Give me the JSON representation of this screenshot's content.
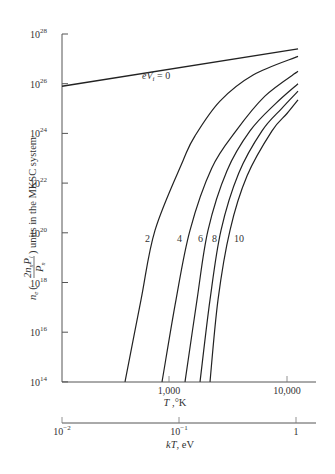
{
  "chart_data": {
    "type": "line",
    "title": "",
    "xlabel": "T, °K",
    "ylabel": "n_e (2 n_n P_i / P_n) units in the MKSC system",
    "secondary_xlabel": "kT, eV",
    "xscale": "log",
    "yscale": "log",
    "xlim": [
      124,
      21000
    ],
    "ylim": [
      100000000000000.0,
      1e+28
    ],
    "grid": false,
    "x_ticks": [
      {
        "value": 1000,
        "label": "1,000"
      },
      {
        "value": 10000,
        "label": "10,000"
      }
    ],
    "y_ticks": [
      {
        "value": 100000000000000.0,
        "base": "10",
        "exp": "14"
      },
      {
        "value": 1e+16,
        "base": "10",
        "exp": "16"
      },
      {
        "value": 1e+18,
        "base": "10",
        "exp": "18"
      },
      {
        "value": 1e+20,
        "base": "10",
        "exp": "20"
      },
      {
        "value": 1e+22,
        "base": "10",
        "exp": "22"
      },
      {
        "value": 1e+24,
        "base": "10",
        "exp": "24"
      },
      {
        "value": 1e+26,
        "base": "10",
        "exp": "26"
      },
      {
        "value": 1e+28,
        "base": "10",
        "exp": "28"
      }
    ],
    "secondary_x_ticks": [
      {
        "value": 0.01,
        "base": "10",
        "exp": "−2"
      },
      {
        "value": 0.1,
        "base": "10",
        "exp": "−1"
      },
      {
        "value": 1,
        "base": "1",
        "exp": ""
      }
    ],
    "series": [
      {
        "name": "eVi = 0",
        "label": "eV",
        "label_sub": "i",
        "label_tail": " = 0",
        "x": [
          124,
          12400
        ],
        "log10_y": [
          25.9,
          27.4
        ]
      },
      {
        "name": "2",
        "label": "2",
        "x": [
          424,
          579,
          761,
          1314,
          1661,
          2704,
          5157,
          12400
        ],
        "log10_y": [
          14.0,
          17.3,
          20.1,
          22.9,
          23.9,
          25.3,
          26.35,
          27.1
        ]
      },
      {
        "name": "4",
        "label": "4",
        "x": [
          873,
          1146,
          1506,
          2300,
          3694,
          6500,
          12400
        ],
        "log10_y": [
          14.0,
          17.3,
          20.1,
          22.6,
          24.1,
          25.5,
          26.5
        ]
      },
      {
        "name": "6",
        "label": "6",
        "x": [
          1366,
          1727,
          2139,
          3100,
          4855,
          8000,
          12400
        ],
        "log10_y": [
          14.0,
          17.3,
          20.1,
          22.5,
          24.1,
          25.2,
          26.0
        ]
      },
      {
        "name": "8",
        "label": "8",
        "x": [
          1831,
          2224,
          2758,
          3900,
          6135,
          9000,
          12400
        ],
        "log10_y": [
          14.0,
          17.3,
          20.1,
          22.4,
          24.1,
          25.0,
          25.7
        ]
      },
      {
        "name": "10",
        "label": "10",
        "x": [
          2226,
          2603,
          3285,
          4600,
          7459,
          10000,
          12400
        ],
        "log10_y": [
          14.0,
          17.3,
          20.1,
          22.3,
          24.1,
          24.8,
          25.35
        ]
      }
    ]
  },
  "ylabel_parts": {
    "ne": "n",
    "ne_sub": "e",
    "open": "(",
    "num": "2n",
    "num_sub": "n",
    "num_p": "P",
    "num_p_sub": "i",
    "den": "P",
    "den_sub": "n",
    "close": ")",
    "tail": " units in the MKSC system"
  },
  "xlabel_parts": {
    "var": "T",
    "unit": " ,°K"
  },
  "secondary_xlabel_parts": {
    "var": "kT",
    "unit": ", eV"
  }
}
